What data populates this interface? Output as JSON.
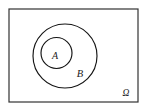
{
  "diagram": {
    "type": "euler-venn-diagram",
    "background_color": "#ffffff",
    "stroke_color": "#141414",
    "universe": {
      "name": "universal-set",
      "label": "Ω",
      "shape": "rectangle",
      "x": 9,
      "y": 9,
      "width": 129,
      "height": 93,
      "border_color": "#333333",
      "label_x": 126,
      "label_y": 96,
      "label_font_size": 9.5
    },
    "sets": [
      {
        "name": "set-b",
        "label": "B",
        "shape": "circle",
        "cx": 65,
        "cy": 56,
        "r": 32,
        "label_x": 80,
        "label_y": 77,
        "label_font_size": 10.5
      },
      {
        "name": "set-a",
        "label": "A",
        "shape": "circle",
        "cx": 56.5,
        "cy": 53,
        "r": 15.5,
        "label_x": 55,
        "label_y": 59,
        "label_font_size": 10
      }
    ]
  }
}
